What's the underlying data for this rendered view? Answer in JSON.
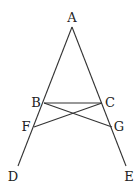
{
  "diagram": {
    "type": "geometry",
    "stroke_color": "#333333",
    "points": {
      "A": {
        "label": "A",
        "x": 72,
        "y": 27,
        "lx": 72,
        "ly": 22
      },
      "B": {
        "label": "B",
        "x": 44,
        "y": 103,
        "lx": 36,
        "ly": 107
      },
      "C": {
        "label": "C",
        "x": 102,
        "y": 103,
        "lx": 110,
        "ly": 107
      },
      "F": {
        "label": "F",
        "x": 34,
        "y": 127,
        "lx": 26,
        "ly": 131
      },
      "G": {
        "label": "G",
        "x": 112,
        "y": 127,
        "lx": 119,
        "ly": 131
      },
      "D": {
        "label": "D",
        "x": 18,
        "y": 166,
        "lx": 13,
        "ly": 181
      },
      "E": {
        "label": "E",
        "x": 126,
        "y": 166,
        "lx": 129,
        "ly": 181
      }
    },
    "segments": [
      {
        "from": "A",
        "to": "D"
      },
      {
        "from": "A",
        "to": "E"
      },
      {
        "from": "B",
        "to": "C"
      },
      {
        "from": "B",
        "to": "G"
      },
      {
        "from": "C",
        "to": "F"
      }
    ]
  }
}
